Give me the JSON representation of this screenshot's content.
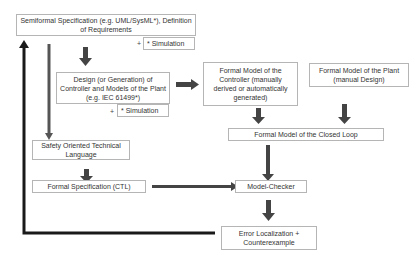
{
  "diagram": {
    "nodes": {
      "semiformal_spec": "Semiformal Specification (e.g. UML/SysML*), Definition of Requirements",
      "simulation_1": "* Simulation",
      "design_generation": "Design (or Generation) of Controller and Models of the Plant (e.g. IEC 61499*)",
      "simulation_2": "* Simulation",
      "formal_model_controller": "Formal Model of the Controller (manually derived or automatically generated)",
      "formal_model_plant": "Formal Model of the Plant (manual Design)",
      "formal_model_closed_loop": "Formal Model of the Closed Loop",
      "safety_language": "Safety Oriented Technical Language",
      "formal_spec_ctl": "Formal Specification (CTL)",
      "model_checker": "Model-Checker",
      "error_localization": "Error Localization + Counterexample"
    },
    "plus_sign": "+",
    "colors": {
      "arrow": "#3a3a3a",
      "feedback_arrow": "#1a1a1a",
      "box_border": "#b5b5b5",
      "text": "#333333"
    }
  }
}
